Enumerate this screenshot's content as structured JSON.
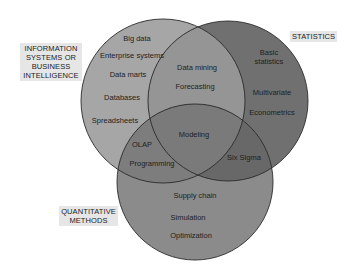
{
  "diagram": {
    "type": "venn",
    "circles": [
      {
        "id": "is_bi",
        "label": "INFORMATION SYSTEMS OR BUSINESS INTELLIGENCE",
        "label_lines": [
          "INFORMATION",
          "SYSTEMS OR",
          "BUSINESS",
          "INTELLIGENCE"
        ],
        "fill": "#a3a3a3",
        "cx": 163,
        "cy": 101,
        "r": 82
      },
      {
        "id": "statistics",
        "label": "STATISTICS",
        "label_lines": [
          "STATISTICS"
        ],
        "fill": "#6e6e6e",
        "cx": 228,
        "cy": 101,
        "r": 80
      },
      {
        "id": "quant",
        "label": "QUANTITATIVE METHODS",
        "label_lines": [
          "QUANTITATIVE",
          "METHODS"
        ],
        "fill": "#8a8a8a",
        "cx": 195,
        "cy": 182,
        "r": 78
      }
    ],
    "regions": {
      "is_bi_only": [
        "Big data",
        "Enterprise systems",
        "Data marts",
        "Databases",
        "Spreadsheets"
      ],
      "is_bi_statistics": [
        "Data mining",
        "Forecasting"
      ],
      "statistics_only": [
        "Basic statistics",
        "Multivariate",
        "Econometrics"
      ],
      "is_bi_quant": [
        "OLAP",
        "Programming"
      ],
      "all_three": [
        "Modeling"
      ],
      "statistics_quant": [
        "Six Sigma"
      ],
      "quant_only": [
        "Supply chain",
        "Simulation",
        "Optimization"
      ]
    },
    "items": {
      "big_data": "Big data",
      "enterprise_systems": "Enterprise systems",
      "data_marts": "Data marts",
      "databases": "Databases",
      "spreadsheets": "Spreadsheets",
      "data_mining": "Data mining",
      "forecasting": "Forecasting",
      "basic_statistics_1": "Basic",
      "basic_statistics_2": "statistics",
      "multivariate": "Multivariate",
      "econometrics": "Econometrics",
      "olap": "OLAP",
      "programming": "Programming",
      "modeling": "Modeling",
      "six_sigma": "Six Sigma",
      "supply_chain": "Supply chain",
      "simulation": "Simulation",
      "optimization": "Optimization"
    },
    "labels": {
      "is_bi_1": "INFORMATION",
      "is_bi_2": "SYSTEMS OR",
      "is_bi_3": "BUSINESS",
      "is_bi_4": "INTELLIGENCE",
      "statistics": "STATISTICS",
      "quant_1": "QUANTITATIVE",
      "quant_2": "METHODS"
    }
  }
}
